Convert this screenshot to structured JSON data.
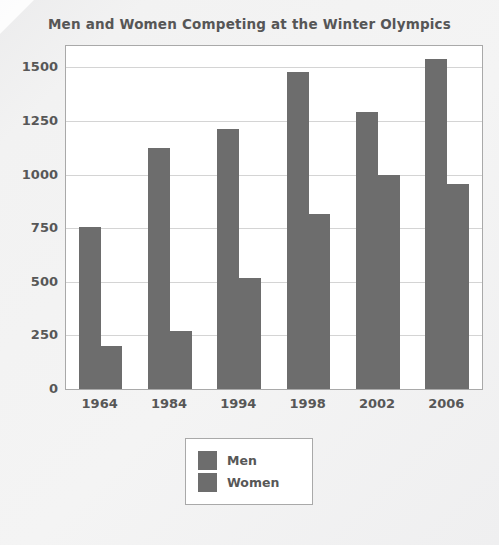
{
  "chart_data": {
    "type": "bar",
    "title": "Men and Women Competing at the Winter Olympics",
    "xlabel": "",
    "ylabel": "",
    "categories": [
      "1964",
      "1984",
      "1994",
      "1998",
      "2002",
      "2006"
    ],
    "series": [
      {
        "name": "Men",
        "values": [
          755,
          1125,
          1215,
          1480,
          1290,
          1540
        ],
        "color": "#6d6d6d"
      },
      {
        "name": "Women",
        "values": [
          200,
          270,
          520,
          815,
          1000,
          955
        ],
        "color": "#6d6d6d"
      }
    ],
    "yticks": [
      0,
      250,
      500,
      750,
      1000,
      1250,
      1500
    ],
    "ytick_labels": [
      "0",
      "250",
      "500",
      "750",
      "1000",
      "1250",
      "1500"
    ],
    "ylim": [
      0,
      1600
    ],
    "grid": true,
    "grid_axis": "y",
    "legend_position": "below-plot-center",
    "legend_entries": [
      "Men",
      "Women"
    ],
    "bar_color": "#6d6d6d",
    "background_color": "#ffffff",
    "axis_color": "#a9a9a9",
    "text_color": "#575757"
  }
}
